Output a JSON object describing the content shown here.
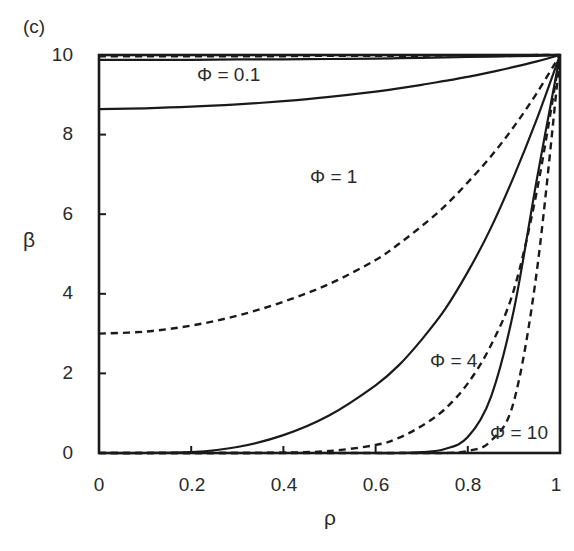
{
  "panel_label": "(c)",
  "chart_data": {
    "type": "line",
    "title": "",
    "xlabel": "ρ",
    "ylabel": "β",
    "xlim": [
      0,
      1
    ],
    "ylim": [
      0,
      10
    ],
    "grid": false,
    "legend": "none (inline annotations)",
    "x_ticks": [
      "0",
      "0.2",
      "0.4",
      "0.6",
      "0.8",
      "1"
    ],
    "y_ticks": [
      "0",
      "2",
      "4",
      "6",
      "8",
      "10"
    ],
    "x": [
      0,
      0.1,
      0.2,
      0.3,
      0.4,
      0.5,
      0.6,
      0.65,
      0.7,
      0.75,
      0.8,
      0.85,
      0.9,
      0.95,
      1.0
    ],
    "series": [
      {
        "name": "Φ = 0.1 (dashed)",
        "style": "dashed",
        "values": [
          9.97,
          9.97,
          9.97,
          9.97,
          9.97,
          9.98,
          9.98,
          9.98,
          9.98,
          9.99,
          9.99,
          9.99,
          9.99,
          10,
          10
        ]
      },
      {
        "name": "Φ = 0.1 (solid)",
        "style": "solid",
        "values": [
          9.88,
          9.88,
          9.88,
          9.89,
          9.89,
          9.9,
          9.91,
          9.92,
          9.93,
          9.94,
          9.95,
          9.96,
          9.97,
          9.98,
          10
        ]
      },
      {
        "name": "Φ = 1 (solid)",
        "style": "solid",
        "values": [
          8.64,
          8.66,
          8.7,
          8.76,
          8.84,
          8.95,
          9.08,
          9.16,
          9.25,
          9.35,
          9.45,
          9.57,
          9.7,
          9.84,
          10
        ]
      },
      {
        "name": "Φ = 1 (dashed)",
        "style": "dashed",
        "values": [
          3.0,
          3.05,
          3.2,
          3.45,
          3.8,
          4.25,
          4.85,
          5.25,
          5.7,
          6.2,
          6.8,
          7.45,
          8.2,
          9.05,
          10
        ]
      },
      {
        "name": "Φ = 4 (solid)",
        "style": "solid",
        "values": [
          0.0,
          0.0,
          0.02,
          0.15,
          0.45,
          0.95,
          1.7,
          2.2,
          2.85,
          3.6,
          4.55,
          5.65,
          6.95,
          8.4,
          10
        ]
      },
      {
        "name": "Φ = 4 (dashed)",
        "style": "dashed",
        "values": [
          0.0,
          0.0,
          0.0,
          0.0,
          0.01,
          0.05,
          0.2,
          0.38,
          0.68,
          1.1,
          1.75,
          2.7,
          4.1,
          6.6,
          10
        ]
      },
      {
        "name": "Φ = 10 (solid)",
        "style": "solid",
        "values": [
          0.0,
          0.0,
          0.0,
          0.0,
          0.0,
          0.0,
          0.0,
          0.0,
          0.02,
          0.1,
          0.4,
          1.4,
          3.6,
          6.9,
          10
        ]
      },
      {
        "name": "Φ = 10 (dashed)",
        "style": "dashed",
        "values": [
          0.0,
          0.0,
          0.0,
          0.0,
          0.0,
          0.0,
          0.0,
          0.0,
          0.0,
          0.0,
          0.05,
          0.3,
          1.3,
          4.6,
          10
        ]
      }
    ],
    "annotations": [
      {
        "text": "Φ = 0.1",
        "x": 0.28,
        "y": 9.5
      },
      {
        "text": "Φ = 1",
        "x": 0.5,
        "y": 7.0
      },
      {
        "text": "Φ = 4",
        "x": 0.77,
        "y": 2.6
      },
      {
        "text": "Φ = 10",
        "x": 0.91,
        "y": 0.45
      }
    ]
  },
  "axes": {
    "x_label": "ρ",
    "y_label": "β",
    "x_ticks": [
      "0",
      "0.2",
      "0.4",
      "0.6",
      "0.8",
      "1"
    ],
    "y_ticks": [
      "0",
      "2",
      "4",
      "6",
      "8",
      "10"
    ]
  },
  "annotations": {
    "phi_01": "Φ = 0.1",
    "phi_1": "Φ = 1",
    "phi_4": "Φ = 4",
    "phi_10": "Φ = 10"
  },
  "colors": {
    "line": "#1a1a1a",
    "axis": "#1a1a1a",
    "background": "#ffffff"
  }
}
